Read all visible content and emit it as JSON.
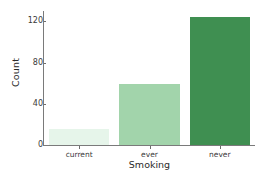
{
  "chart_data": {
    "type": "bar",
    "title": "",
    "subtitle": "",
    "xlabel": "Smoking",
    "ylabel": "Count",
    "categories": [
      "current",
      "ever",
      "never"
    ],
    "values": [
      16,
      59,
      124
    ],
    "series": [
      {
        "name": "Count",
        "values": [
          16,
          59,
          124
        ]
      }
    ],
    "bar_colors": [
      "#e6f5ea",
      "#a2d4ab",
      "#3f8f51"
    ],
    "ylim": [
      0,
      130
    ],
    "yticks": [
      0,
      40,
      80,
      120
    ],
    "ytick_labels": [
      "0",
      "40",
      "80",
      "120"
    ],
    "xtick_labels": [
      "current",
      "ever",
      "never"
    ],
    "grid": false,
    "legend": false,
    "legend_position": "none",
    "background_color": "#ffffff",
    "axis_color": "#7a7a7a",
    "text_color": "#2b2b2b"
  },
  "axes": {
    "y_title": "Count",
    "x_title": "Smoking"
  }
}
